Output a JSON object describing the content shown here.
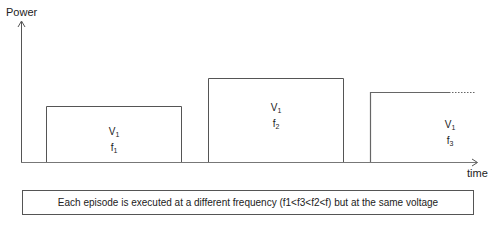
{
  "axes": {
    "y_label": "Power",
    "x_label": "time"
  },
  "episodes": [
    {
      "voltage": "V",
      "freq_base": "f",
      "freq_sub": "1"
    },
    {
      "voltage": "V",
      "freq_base": "f",
      "freq_sub": "2"
    },
    {
      "voltage": "V",
      "freq_base": "f",
      "freq_sub": "3"
    }
  ],
  "caption": "Each episode is executed at a different frequency (f1<f3<f2<f) but at the same voltage",
  "colors": {
    "line": "#555555",
    "text": "#222222"
  }
}
